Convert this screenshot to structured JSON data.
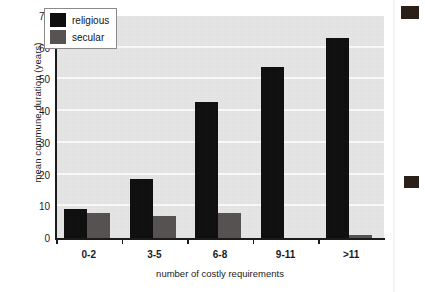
{
  "chart_data": {
    "type": "bar",
    "title": "",
    "xlabel": "number of costly requirements",
    "ylabel": "mean commune duration (years)",
    "categories": [
      "0-2",
      "3-5",
      "6-8",
      "9-11",
      ">11"
    ],
    "series": [
      {
        "name": "religious",
        "color": "#0d0d0d",
        "values": [
          9,
          18.5,
          43,
          54,
          63
        ]
      },
      {
        "name": "secular",
        "color": "#545150",
        "values": [
          8,
          7,
          8,
          0,
          1
        ]
      }
    ],
    "ylim": [
      0,
      70
    ],
    "yticks": [
      0,
      10,
      20,
      30,
      40,
      50,
      60,
      70
    ],
    "ytick_labels": [
      "0",
      "10",
      "20",
      "30",
      "40",
      "50",
      "60",
      "70"
    ],
    "grid": "horizontal-white",
    "legend_position": "upper-left-inside",
    "plot_background": "#e6e6e6"
  },
  "legend": {
    "items": [
      {
        "label": "religious",
        "swatch": "religious"
      },
      {
        "label": "secular",
        "swatch": "secular"
      }
    ]
  }
}
